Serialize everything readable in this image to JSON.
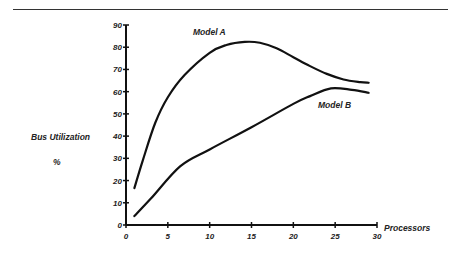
{
  "chart_data": {
    "type": "line",
    "title": "",
    "xlabel": "Processors",
    "ylabel": "Bus Utilization %",
    "ylabel_line1": "Bus Utilization",
    "ylabel_line2": "%",
    "xlim": [
      0,
      30
    ],
    "ylim": [
      0,
      90
    ],
    "xticks": [
      0,
      5,
      10,
      15,
      20,
      25,
      30
    ],
    "yticks": [
      0,
      10,
      20,
      30,
      40,
      50,
      60,
      70,
      80,
      90
    ],
    "grid": false,
    "legend": "inline annotations",
    "series": [
      {
        "name": "Model A",
        "x": [
          1,
          2,
          3.5,
          5,
          7,
          10,
          12,
          14.2,
          16,
          18,
          20,
          22,
          24,
          26,
          28,
          29
        ],
        "y": [
          16.6,
          29,
          46,
          57.5,
          67.5,
          77.5,
          81,
          82.4,
          82,
          79.5,
          75.5,
          71.5,
          68,
          65.5,
          64.3,
          64
        ]
      },
      {
        "name": "Model B",
        "x": [
          1,
          3,
          6.5,
          10,
          15,
          20,
          22,
          24.5,
          27,
          29
        ],
        "y": [
          4,
          12,
          26.5,
          34,
          44,
          54.5,
          58,
          61.5,
          60.8,
          59.5
        ]
      }
    ],
    "annotations": [
      {
        "text": "Model A",
        "near_x": 13,
        "near_y": 89
      },
      {
        "text": "Model B",
        "near_x": 24,
        "near_y": 51
      }
    ]
  }
}
